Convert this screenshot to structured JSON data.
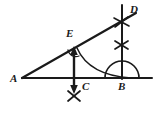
{
  "figure": {
    "kind": "geometry-construction-diagram",
    "background_color": "#ffffff",
    "stroke_color": "#1a1a1a",
    "canvas": {
      "width": 159,
      "height": 116
    }
  },
  "labels": [
    {
      "id": "A",
      "text": "A",
      "x": 10,
      "y": 73
    },
    {
      "id": "E",
      "text": "E",
      "x": 66,
      "y": 28
    },
    {
      "id": "D",
      "text": "D",
      "x": 130,
      "y": 4
    },
    {
      "id": "C",
      "text": "C",
      "x": 82,
      "y": 81
    },
    {
      "id": "B",
      "text": "B",
      "x": 118,
      "y": 81
    }
  ],
  "points": {
    "A": {
      "x": 22,
      "y": 78
    },
    "B": {
      "x": 122,
      "y": 78
    },
    "C": {
      "x": 74,
      "y": 78
    },
    "D": {
      "x": 122,
      "y": 22
    },
    "E": {
      "x": 74,
      "y": 50
    }
  },
  "segments": [
    {
      "name": "base-AB",
      "x1": 22,
      "y1": 78,
      "x2": 152,
      "y2": 78
    },
    {
      "name": "hypotenuse-AD",
      "x1": 22,
      "y1": 78,
      "x2": 135,
      "y2": 14
    },
    {
      "name": "vertical-BD",
      "x1": 122,
      "y1": 5,
      "x2": 122,
      "y2": 78
    }
  ],
  "arrow": {
    "name": "double-headed-arrow-through-C",
    "x": 74,
    "y_top": 48,
    "y_bottom": 92
  },
  "arcs": [
    {
      "name": "semicircle-at-B",
      "cx": 122,
      "cy": 78,
      "r": 17
    },
    {
      "name": "construction-arc-E-to-B",
      "from_x": 76,
      "from_y": 49,
      "to_x": 128,
      "to_y": 77
    },
    {
      "name": "angle-mark-at-E",
      "cx": 74,
      "cy": 52,
      "r": 7
    }
  ],
  "tick_marks": [
    {
      "name": "cross-tick-on-BD-upper",
      "x": 121,
      "y": 22
    },
    {
      "name": "cross-tick-on-BD-lower",
      "x": 121,
      "y": 45
    },
    {
      "name": "cross-tick-below-C",
      "x": 74,
      "y": 96
    }
  ]
}
